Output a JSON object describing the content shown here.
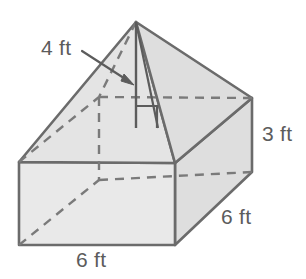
{
  "figure": {
    "kind": "composite-solid",
    "colors": {
      "background": "#ffffff",
      "face_light": "#e9e9e9",
      "face_mid": "#e3e3e3",
      "face_shadow": "#dcdcdc",
      "stroke": "#6b6b6b",
      "hidden_stroke": "#7a7a7a",
      "text": "#5c5c5c"
    },
    "labels": {
      "pyramid_height": "4 ft",
      "prism_height": "3 ft",
      "prism_depth": "6 ft",
      "prism_width": "6 ft"
    },
    "annotations": {
      "leader_arrow": "arrow-pointing-to-pyramid-height",
      "right_angle_marker": "right-angle-at-pyramid-base"
    }
  }
}
